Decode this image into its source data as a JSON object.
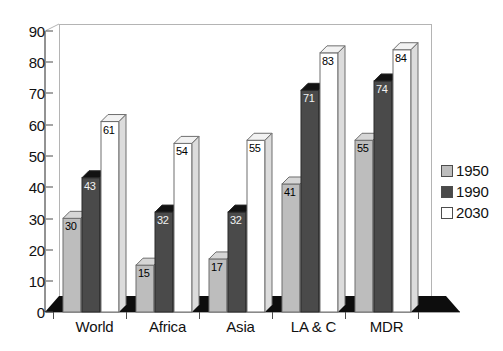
{
  "chart_data": {
    "type": "bar",
    "title": "",
    "subtitle": "",
    "xlabel": "",
    "ylabel": "",
    "categories": [
      "World",
      "Africa",
      "Asia",
      "LA & C",
      "MDR"
    ],
    "series": [
      {
        "name": "1950",
        "color": "#bdbdbd",
        "values": [
          30,
          15,
          17,
          41,
          55
        ]
      },
      {
        "name": "1990",
        "color": "#4a4a4a",
        "values": [
          43,
          32,
          32,
          71,
          74
        ]
      },
      {
        "name": "2030",
        "color": "#ffffff",
        "values": [
          61,
          54,
          55,
          83,
          84
        ]
      }
    ],
    "ylim": [
      0,
      90
    ],
    "ytick_step": 10,
    "ytick_labels": [
      "0",
      "10",
      "20",
      "30",
      "40",
      "50",
      "60",
      "70",
      "80",
      "90"
    ],
    "grid": false,
    "legend_position": "right",
    "data_labels": true,
    "style": "3d-column"
  },
  "legend": {
    "entries": [
      {
        "label": "1950",
        "swatch": "#bdbdbd"
      },
      {
        "label": "1990",
        "swatch": "#4a4a4a"
      },
      {
        "label": "2030",
        "swatch": "#ffffff"
      }
    ]
  },
  "axis": {
    "y_labels": [
      "90",
      "80",
      "70",
      "60",
      "50",
      "40",
      "30",
      "20",
      "10",
      "0"
    ],
    "x_labels": [
      "World",
      "Africa",
      "Asia",
      "LA & C",
      "MDR"
    ]
  }
}
